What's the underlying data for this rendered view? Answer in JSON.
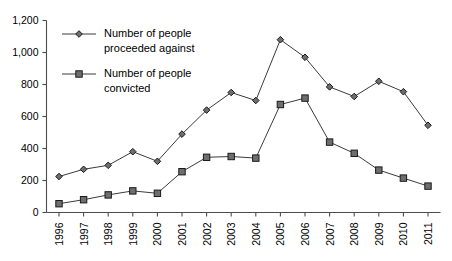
{
  "chart_data": {
    "type": "line",
    "title": "",
    "subtitle": "",
    "xlabel": "",
    "ylabel": "",
    "grid": false,
    "legend_position": "top-left-inside",
    "categories": [
      "1996",
      "1997",
      "1998",
      "1999",
      "2000",
      "2001",
      "2002",
      "2003",
      "2004",
      "2005",
      "2006",
      "2007",
      "2008",
      "2009",
      "2010",
      "2011"
    ],
    "ylim": [
      0,
      1200
    ],
    "ytick_values": [
      0,
      200,
      400,
      600,
      800,
      1000,
      1200
    ],
    "ytick_labels": [
      "0",
      "200",
      "400",
      "600",
      "800",
      "1,000",
      "1,200"
    ],
    "series": [
      {
        "name": "Number of people proceeded against",
        "marker": "diamond",
        "values": [
          225,
          270,
          295,
          380,
          320,
          490,
          640,
          750,
          700,
          1080,
          970,
          785,
          725,
          820,
          755,
          545
        ]
      },
      {
        "name": "Number of people convicted",
        "marker": "square",
        "values": [
          55,
          80,
          110,
          135,
          120,
          255,
          345,
          350,
          340,
          675,
          715,
          440,
          370,
          265,
          215,
          165
        ]
      }
    ],
    "colors": {
      "marker_fill": "#6e6e6e",
      "marker_stroke": "#1a1a1a",
      "line": "#3b3b3b",
      "axis": "#4d4d4d",
      "background": "#ffffff",
      "text": "#000000"
    }
  },
  "legend": {
    "entries": [
      {
        "label_line1": "Number of people",
        "label_line2": "proceeded against",
        "marker": "diamond"
      },
      {
        "label_line1": "Number of people",
        "label_line2": "convicted",
        "marker": "square"
      }
    ]
  }
}
